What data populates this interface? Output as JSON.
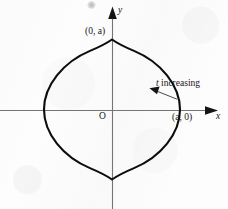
{
  "figure": {
    "kind": "astroid-parametric-curve-diagram",
    "background_color": "#fdfdfd",
    "curve_color": "#0d0d0d",
    "axis_color": "#6e6e72",
    "text_color": "#161616"
  },
  "axes": {
    "x_label": "x",
    "y_label": "y",
    "origin_label": "O",
    "x_axis_y_px": 110,
    "y_axis_x_px": 112,
    "x_arrow_tip_px": 215,
    "y_arrow_tip_px": 8
  },
  "labels": {
    "point_top": "(0, a)",
    "point_right": "(a, 0)",
    "annotation": "t increasing"
  },
  "chart_data": {
    "type": "line",
    "title": "",
    "subtitle": "",
    "xlabel": "x",
    "ylabel": "y",
    "grid": false,
    "legend": null,
    "curve_name": "astroid",
    "equation_parametric": [
      "x = a cos^3 t",
      "y = a sin^3 t"
    ],
    "equation_implicit": "x^(2/3) + y^(2/3) = a^(2/3)",
    "parameter": "t",
    "parameter_direction": "increasing",
    "amplitude_symbol": "a",
    "cusps": [
      {
        "label": "(a, 0)",
        "x": 1,
        "y": 0,
        "px": [
          178,
          110
        ],
        "labeled": true
      },
      {
        "label": "(0, a)",
        "x": 0,
        "y": 1,
        "px": [
          113,
          40
        ],
        "labeled": true
      },
      {
        "label": "(-a, 0)",
        "x": -1,
        "y": 0,
        "px": [
          42,
          110
        ],
        "labeled": false
      },
      {
        "label": "(0, -a)",
        "x": 0,
        "y": -1,
        "px": [
          112,
          178
        ],
        "labeled": false
      }
    ],
    "xlim": [
      -1.65,
      1.52
    ],
    "ylim": [
      -1.43,
      1.48
    ],
    "annotations": [
      {
        "text": "t increasing",
        "arrow_from_px": [
          177,
          99
        ],
        "arrow_to_px": [
          151,
          89
        ],
        "points_to": "curve in first quadrant"
      }
    ]
  }
}
